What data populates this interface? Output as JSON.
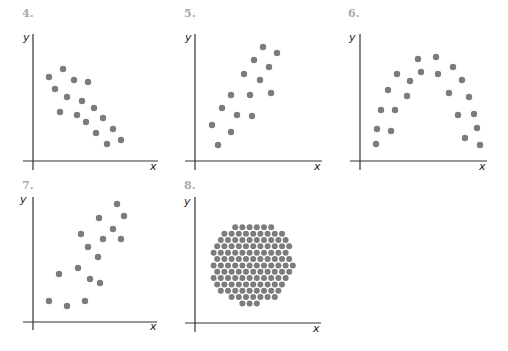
{
  "chart_data": [
    {
      "type": "scatter",
      "label": "4.",
      "xlabel": "x",
      "ylabel": "y",
      "description": "negative linear correlation",
      "grid": false,
      "box": {
        "ox": 33,
        "oy": 161,
        "xend": 158,
        "ytop": 34,
        "xstart": 23,
        "ybottom": 170,
        "label_x": 22,
        "label_y": 17,
        "ylabel_x": 23,
        "ylabel_y": 41,
        "xlabel_x": 150,
        "xlabel_y": 170
      },
      "points": [
        [
          63,
          69
        ],
        [
          49,
          77
        ],
        [
          74,
          80
        ],
        [
          88,
          82
        ],
        [
          55,
          89
        ],
        [
          67,
          97
        ],
        [
          82,
          101
        ],
        [
          94,
          108
        ],
        [
          60,
          112
        ],
        [
          77,
          115
        ],
        [
          103,
          118
        ],
        [
          86,
          122
        ],
        [
          113,
          129
        ],
        [
          96,
          133
        ],
        [
          121,
          140
        ],
        [
          107,
          144
        ]
      ]
    },
    {
      "type": "scatter",
      "label": "5.",
      "xlabel": "x",
      "ylabel": "y",
      "description": "positive linear correlation",
      "grid": false,
      "box": {
        "ox": 195,
        "oy": 161,
        "xend": 322,
        "ytop": 34,
        "xstart": 185,
        "ybottom": 170,
        "label_x": 184,
        "label_y": 17,
        "ylabel_x": 185,
        "ylabel_y": 41,
        "xlabel_x": 314,
        "xlabel_y": 170
      },
      "points": [
        [
          263,
          47
        ],
        [
          277,
          53
        ],
        [
          254,
          60
        ],
        [
          269,
          67
        ],
        [
          244,
          74
        ],
        [
          260,
          80
        ],
        [
          231,
          95
        ],
        [
          250,
          95
        ],
        [
          271,
          93
        ],
        [
          222,
          108
        ],
        [
          237,
          115
        ],
        [
          252,
          116
        ],
        [
          212,
          125
        ],
        [
          231,
          132
        ],
        [
          218,
          145
        ]
      ]
    },
    {
      "type": "scatter",
      "label": "6.",
      "xlabel": "x",
      "ylabel": "y",
      "description": "non-linear (inverted U / quadratic) relationship",
      "grid": false,
      "box": {
        "ox": 360,
        "oy": 161,
        "xend": 487,
        "ytop": 34,
        "xstart": 350,
        "ybottom": 170,
        "label_x": 348,
        "label_y": 17,
        "ylabel_x": 349,
        "ylabel_y": 41,
        "xlabel_x": 479,
        "xlabel_y": 170
      },
      "points": [
        [
          418,
          59
        ],
        [
          436,
          57
        ],
        [
          453,
          67
        ],
        [
          397,
          74
        ],
        [
          421,
          72
        ],
        [
          438,
          74
        ],
        [
          410,
          81
        ],
        [
          462,
          80
        ],
        [
          388,
          90
        ],
        [
          407,
          96
        ],
        [
          449,
          93
        ],
        [
          469,
          97
        ],
        [
          381,
          110
        ],
        [
          395,
          110
        ],
        [
          458,
          115
        ],
        [
          474,
          114
        ],
        [
          377,
          129
        ],
        [
          391,
          131
        ],
        [
          477,
          128
        ],
        [
          465,
          138
        ],
        [
          376,
          144
        ],
        [
          480,
          145
        ]
      ]
    },
    {
      "type": "scatter",
      "label": "7.",
      "xlabel": "x",
      "ylabel": "y",
      "description": "positive linear correlation (weaker)",
      "grid": false,
      "box": {
        "ox": 33,
        "oy": 322,
        "xend": 157,
        "ytop": 197,
        "xstart": 23,
        "ybottom": 330,
        "label_x": 22,
        "label_y": 189,
        "ylabel_x": 20,
        "ylabel_y": 203,
        "xlabel_x": 150,
        "xlabel_y": 330
      },
      "points": [
        [
          117,
          204
        ],
        [
          124,
          216
        ],
        [
          99,
          218
        ],
        [
          113,
          229
        ],
        [
          81,
          234
        ],
        [
          103,
          239
        ],
        [
          121,
          239
        ],
        [
          88,
          247
        ],
        [
          98,
          257
        ],
        [
          78,
          268
        ],
        [
          59,
          274
        ],
        [
          90,
          279
        ],
        [
          100,
          283
        ],
        [
          49,
          301
        ],
        [
          67,
          306
        ],
        [
          85,
          301
        ]
      ]
    },
    {
      "type": "scatter",
      "label": "8.",
      "xlabel": "x",
      "ylabel": "y",
      "description": "no correlation (circular cloud of points)",
      "grid": false,
      "box": {
        "ox": 195,
        "oy": 323,
        "xend": 321,
        "ytop": 197,
        "xstart": 185,
        "ybottom": 332,
        "label_x": 184,
        "label_y": 189,
        "ylabel_x": 184,
        "ylabel_y": 205,
        "xlabel_x": 313,
        "xlabel_y": 332
      },
      "cluster": {
        "cx": 252,
        "cy": 263,
        "r": 42,
        "spacing": 7.2,
        "dot_r": 3
      }
    }
  ]
}
